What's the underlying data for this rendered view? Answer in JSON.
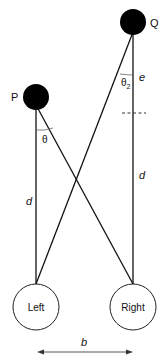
{
  "diagram": {
    "points": {
      "P": "P",
      "Q": "Q"
    },
    "angles": {
      "theta": "θ",
      "theta2": "θ",
      "theta2_sub": "2"
    },
    "distances": {
      "d_left": "d",
      "d_right": "d",
      "e": "e",
      "b": "b"
    },
    "receivers": {
      "left": "Left",
      "right": "Right"
    },
    "colors": {
      "stroke": "#111111",
      "fill_points": "#000000",
      "dashed": "#333333",
      "arrow": "#555555"
    }
  }
}
